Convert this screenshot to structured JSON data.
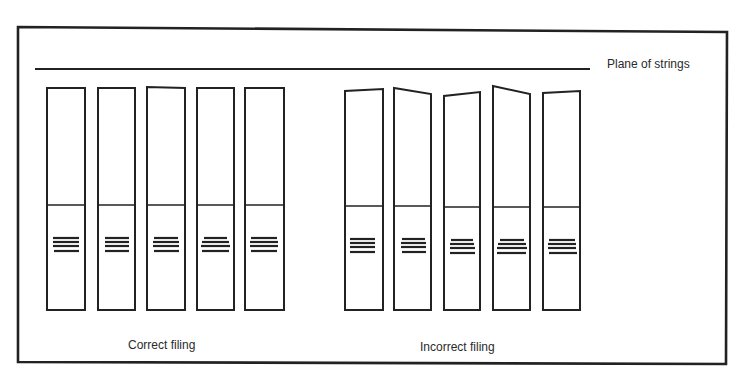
{
  "labels": {
    "plane": "Plane of strings",
    "correct": "Correct filing",
    "incorrect": "Incorrect filing"
  },
  "colors": {
    "stroke": "#222222",
    "background": "#ffffff"
  },
  "groups": [
    {
      "name": "correct",
      "folders": [
        {
          "x1": 47,
          "x2": 85,
          "topL": 88,
          "topR": 88,
          "div": 205,
          "bottom": 310,
          "lines": [
            {
              "y": 238,
              "x1": 53,
              "x2": 79
            },
            {
              "y": 242,
              "x1": 53,
              "x2": 79
            },
            {
              "y": 246,
              "x1": 53,
              "x2": 79
            },
            {
              "y": 251,
              "x1": 54,
              "x2": 79
            }
          ]
        },
        {
          "x1": 98,
          "x2": 135,
          "topL": 88,
          "topR": 88,
          "div": 205,
          "bottom": 310,
          "lines": [
            {
              "y": 238,
              "x1": 105,
              "x2": 129
            },
            {
              "y": 242,
              "x1": 105,
              "x2": 129
            },
            {
              "y": 246,
              "x1": 105,
              "x2": 129
            },
            {
              "y": 251,
              "x1": 105,
              "x2": 129
            }
          ]
        },
        {
          "x1": 147,
          "x2": 185,
          "topL": 87,
          "topR": 88,
          "div": 205,
          "bottom": 310,
          "lines": [
            {
              "y": 238,
              "x1": 154,
              "x2": 178
            },
            {
              "y": 242,
              "x1": 153,
              "x2": 179
            },
            {
              "y": 246,
              "x1": 153,
              "x2": 179
            },
            {
              "y": 251,
              "x1": 154,
              "x2": 179
            }
          ]
        },
        {
          "x1": 197,
          "x2": 234,
          "topL": 88,
          "topR": 88,
          "div": 205,
          "bottom": 310,
          "lines": [
            {
              "y": 238,
              "x1": 204,
              "x2": 227
            },
            {
              "y": 242,
              "x1": 202,
              "x2": 229
            },
            {
              "y": 246,
              "x1": 201,
              "x2": 230
            },
            {
              "y": 251,
              "x1": 202,
              "x2": 229
            }
          ]
        },
        {
          "x1": 245,
          "x2": 284,
          "topL": 88,
          "topR": 88,
          "div": 205,
          "bottom": 310,
          "lines": [
            {
              "y": 238,
              "x1": 251,
              "x2": 277
            },
            {
              "y": 242,
              "x1": 250,
              "x2": 278
            },
            {
              "y": 246,
              "x1": 250,
              "x2": 278
            },
            {
              "y": 251,
              "x1": 251,
              "x2": 277
            }
          ]
        }
      ]
    },
    {
      "name": "incorrect",
      "folders": [
        {
          "x1": 345,
          "x2": 383,
          "topL": 91,
          "topR": 89,
          "div": 206,
          "bottom": 310,
          "lines": [
            {
              "y": 239,
              "x1": 350,
              "x2": 375
            },
            {
              "y": 243,
              "x1": 350,
              "x2": 375
            },
            {
              "y": 247,
              "x1": 350,
              "x2": 375
            },
            {
              "y": 252,
              "x1": 350,
              "x2": 375
            }
          ]
        },
        {
          "x1": 394,
          "x2": 431,
          "topL": 88,
          "topR": 94,
          "div": 206,
          "bottom": 310,
          "lines": [
            {
              "y": 239,
              "x1": 402,
              "x2": 425
            },
            {
              "y": 243,
              "x1": 401,
              "x2": 426
            },
            {
              "y": 247,
              "x1": 401,
              "x2": 426
            },
            {
              "y": 252,
              "x1": 402,
              "x2": 426
            }
          ]
        },
        {
          "x1": 444,
          "x2": 480,
          "topL": 96,
          "topR": 92,
          "div": 207,
          "bottom": 310,
          "lines": [
            {
              "y": 240,
              "x1": 451,
              "x2": 473
            },
            {
              "y": 244,
              "x1": 450,
              "x2": 474
            },
            {
              "y": 248,
              "x1": 450,
              "x2": 475
            },
            {
              "y": 253,
              "x1": 450,
              "x2": 475
            }
          ]
        },
        {
          "x1": 493,
          "x2": 530,
          "topL": 86,
          "topR": 94,
          "div": 207,
          "bottom": 310,
          "lines": [
            {
              "y": 240,
              "x1": 500,
              "x2": 524
            },
            {
              "y": 244,
              "x1": 498,
              "x2": 526
            },
            {
              "y": 248,
              "x1": 497,
              "x2": 527
            },
            {
              "y": 253,
              "x1": 497,
              "x2": 526
            }
          ]
        },
        {
          "x1": 543,
          "x2": 580,
          "topL": 93,
          "topR": 91,
          "div": 207,
          "bottom": 310,
          "lines": [
            {
              "y": 240,
              "x1": 549,
              "x2": 575
            },
            {
              "y": 244,
              "x1": 548,
              "x2": 576
            },
            {
              "y": 248,
              "x1": 548,
              "x2": 576
            },
            {
              "y": 253,
              "x1": 549,
              "x2": 577
            }
          ]
        }
      ]
    }
  ]
}
